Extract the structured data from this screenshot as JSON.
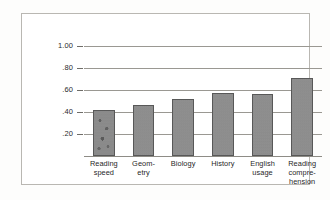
{
  "chart_data": {
    "type": "bar",
    "title": "",
    "subtitle": "",
    "xlabel": "",
    "ylabel": "Correlation with I.Q.",
    "categories": [
      "Reading speed",
      "Geometry",
      "Biology",
      "History",
      "English usage",
      "Reading comprehension"
    ],
    "category_label_lines": [
      [
        "Reading",
        "speed"
      ],
      [
        "Geom-",
        "etry"
      ],
      [
        "Biology"
      ],
      [
        "History"
      ],
      [
        "English",
        "usage"
      ],
      [
        "Reading",
        "compre-",
        "hension"
      ]
    ],
    "values": [
      0.42,
      0.46,
      0.52,
      0.575,
      0.565,
      0.71
    ],
    "ylim": [
      0,
      1.0
    ],
    "ytick_values": [
      1.0,
      0.8,
      0.6,
      0.4,
      0.2
    ],
    "ytick_labels": [
      "1.00",
      ".80",
      ".60",
      ".40",
      ".20"
    ],
    "grid": true,
    "grid_axis": "y",
    "legend": false,
    "legend_position": "none",
    "bar_color": "#8d8d8d",
    "bar_edge_color": "#585858",
    "grid_color": "#9a9892",
    "frame_color": "#b9b7b2",
    "text_color": "#1f1f1f",
    "background_color": "#ffffff"
  }
}
